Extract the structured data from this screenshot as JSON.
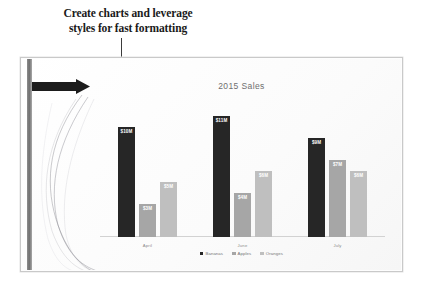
{
  "annotation": {
    "line1": "Create charts and leverage",
    "line2": "styles for fast formatting",
    "connector": "callout-line",
    "dot": "callout-endpoint-dot"
  },
  "slide": {
    "design_bar": "vertical-accent-bar",
    "arrow": "black-arrow-shape",
    "swoosh": "decorative-curved-lines",
    "background_color": "#fdfdfd",
    "border_color": "#c9c9c9"
  },
  "chart_data": {
    "type": "bar",
    "title": "2015 Sales",
    "xlabel": "",
    "ylabel": "",
    "ylim": [
      0,
      12
    ],
    "grid": false,
    "legend_position": "bottom",
    "categories": [
      "April",
      "June",
      "July"
    ],
    "series": [
      {
        "name": "Bananas",
        "color": "#262626",
        "values": [
          10,
          11,
          9
        ],
        "labels": [
          "$10M",
          "$11M",
          "$9M"
        ]
      },
      {
        "name": "Apples",
        "color": "#a6a6a6",
        "values": [
          3,
          4,
          7
        ],
        "labels": [
          "$3M",
          "$4M",
          "$7M"
        ]
      },
      {
        "name": "Oranges",
        "color": "#bfbfbf",
        "values": [
          5,
          6,
          6
        ],
        "labels": [
          "$5M",
          "$6M",
          "$6M"
        ]
      }
    ]
  }
}
